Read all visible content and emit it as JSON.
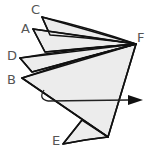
{
  "diagram": {
    "type": "folded-pages-fan",
    "labels": {
      "C": "C",
      "A": "A",
      "D": "D",
      "B": "B",
      "F": "F",
      "E": "E"
    },
    "colors": {
      "stroke": "#111111",
      "fill": "#ececec",
      "label": "#555555"
    },
    "annotations": {
      "arrow": "rotation arrow pointing right through the figure"
    }
  }
}
